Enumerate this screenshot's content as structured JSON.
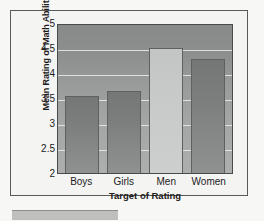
{
  "chart_data": {
    "type": "bar",
    "title": "",
    "subtitle": "",
    "xlabel": "Target of Rating",
    "ylabel": "Mean Rating of Math Ability",
    "categories": [
      "Boys",
      "Girls",
      "Men",
      "Women"
    ],
    "values": [
      3.55,
      3.65,
      4.5,
      4.28
    ],
    "ylim": [
      2,
      5
    ],
    "yticks": [
      2,
      2.5,
      3,
      3.5,
      4,
      4.5,
      5
    ],
    "ytick_labels": [
      "2",
      "2.5",
      "3",
      "3.5",
      "4",
      "4.5",
      "5"
    ],
    "grid": "horizontal",
    "legend": "none",
    "bar_styles": [
      "dark",
      "dark",
      "light",
      "dark"
    ],
    "colors": {
      "bar_dark": "#7c7e7d",
      "bar_light": "#c8cac9",
      "plot_background": "#9a9c9b",
      "gridline": "#e9e9e7",
      "axis": "#4a4a4a",
      "text": "#1c1c1c",
      "page_background": "#f7f7f5",
      "frame_border": "#5a5a5a"
    }
  }
}
